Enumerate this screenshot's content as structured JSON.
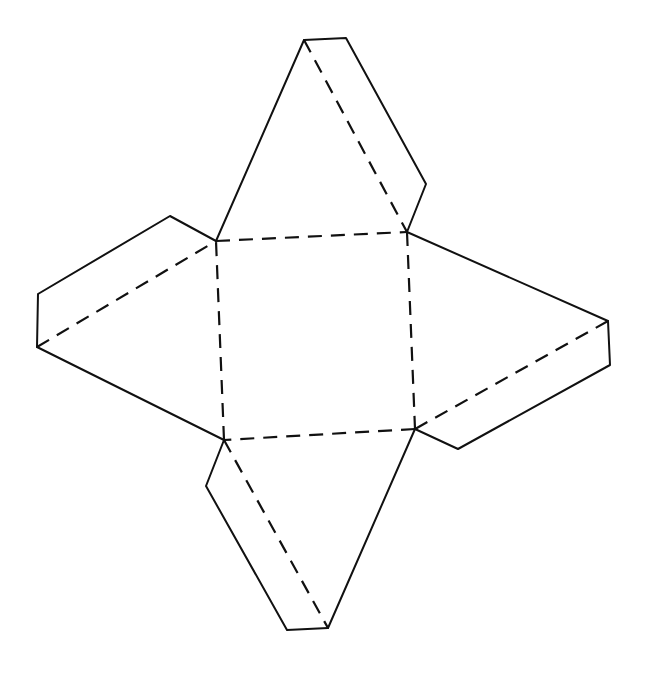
{
  "diagram": {
    "title": "",
    "type": "pyramid-net",
    "stroke_color": "#111111",
    "background": "#ffffff",
    "square_base": {
      "points": [
        [
          216,
          241
        ],
        [
          407,
          232
        ],
        [
          415,
          429
        ],
        [
          224,
          440
        ]
      ],
      "edge_style": "dashed"
    },
    "faces": [
      {
        "name": "top",
        "apex": [
          304,
          40
        ],
        "base": [
          [
            216,
            241
          ],
          [
            407,
            232
          ]
        ],
        "tab": [
          [
            304,
            40
          ],
          [
            346,
            38
          ],
          [
            426,
            184
          ],
          [
            407,
            232
          ]
        ],
        "fold": [
          [
            304,
            40
          ],
          [
            407,
            232
          ]
        ]
      },
      {
        "name": "left",
        "apex": [
          37,
          347
        ],
        "base": [
          [
            216,
            241
          ],
          [
            224,
            440
          ]
        ],
        "tab": [
          [
            216,
            241
          ],
          [
            170,
            216
          ],
          [
            38,
            294
          ],
          [
            37,
            347
          ]
        ],
        "fold": [
          [
            37,
            347
          ],
          [
            216,
            241
          ]
        ]
      },
      {
        "name": "right",
        "apex": [
          608,
          321
        ],
        "base": [
          [
            407,
            232
          ],
          [
            415,
            429
          ]
        ],
        "tab": [
          [
            608,
            321
          ],
          [
            610,
            365
          ],
          [
            458,
            449
          ],
          [
            415,
            429
          ]
        ],
        "fold": [
          [
            608,
            321
          ],
          [
            415,
            429
          ]
        ]
      },
      {
        "name": "bottom",
        "apex": [
          328,
          628
        ],
        "base": [
          [
            224,
            440
          ],
          [
            415,
            429
          ]
        ],
        "tab": [
          [
            224,
            440
          ],
          [
            206,
            486
          ],
          [
            287,
            630
          ],
          [
            328,
            628
          ]
        ],
        "fold": [
          [
            224,
            440
          ],
          [
            328,
            628
          ]
        ]
      }
    ]
  }
}
